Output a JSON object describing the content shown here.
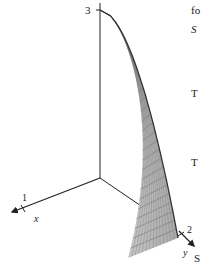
{
  "diagram": {
    "type": "3d-surface-plot",
    "axes": {
      "x": {
        "label": "x",
        "tick": "1"
      },
      "y": {
        "label": "y",
        "tick": "2"
      },
      "z": {
        "label": "",
        "tick": "3"
      }
    },
    "surface": {
      "fill": "#c8c8c8",
      "edge": "#333333",
      "mesh": "#777777"
    }
  },
  "margin_text": {
    "line1": "fo",
    "line2": "S",
    "line3": "T",
    "line4": "T",
    "line5": "S"
  }
}
